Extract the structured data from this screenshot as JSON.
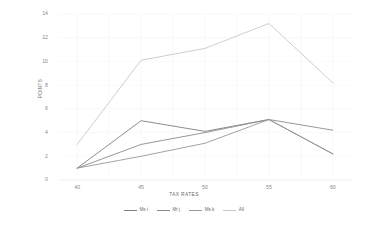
{
  "chart_data": {
    "type": "line",
    "title": "",
    "xlabel": "TAX RATES",
    "ylabel": "POINTS",
    "x": [
      40,
      45,
      50,
      55,
      60
    ],
    "categories": [
      "40",
      "45",
      "50",
      "55",
      "60"
    ],
    "xlim": [
      38.5,
      61.5
    ],
    "ylim": [
      0,
      14
    ],
    "yticks": [
      "0",
      "2",
      "4",
      "6",
      "8",
      "10",
      "12",
      "14"
    ],
    "ytick_values": [
      0,
      2,
      4,
      6,
      8,
      10,
      12,
      14
    ],
    "grid": "horizontal-and-vertical-faint",
    "legend_position": "bottom-center",
    "series": [
      {
        "name": "Ms i",
        "values": [
          1.0,
          5.0,
          4.1,
          5.1,
          2.2
        ],
        "color": "#808080"
      },
      {
        "name": "Mr j",
        "values": [
          1.0,
          3.0,
          4.0,
          5.1,
          4.2
        ],
        "color": "#8c8c8c"
      },
      {
        "name": "Ms k",
        "values": [
          1.0,
          2.0,
          3.1,
          5.1,
          2.2
        ],
        "color": "#999999"
      },
      {
        "name": "All",
        "values": [
          3.0,
          10.1,
          11.1,
          13.2,
          8.2
        ],
        "color": "#c8c8c8"
      }
    ]
  },
  "legend": {
    "items": [
      {
        "label": "Ms i"
      },
      {
        "label": "Mr j"
      },
      {
        "label": "Ms k"
      },
      {
        "label": "All"
      }
    ]
  },
  "axes": {
    "x_title": "TAX RATES",
    "y_title": "POINTS"
  }
}
